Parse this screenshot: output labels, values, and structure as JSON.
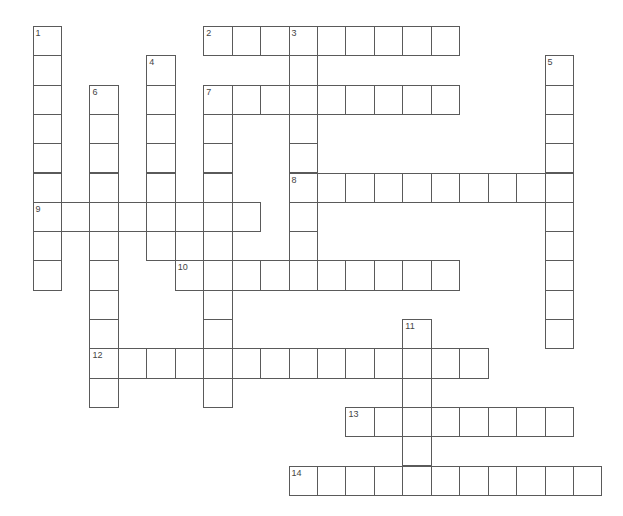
{
  "puzzle": {
    "type": "crossword",
    "grid": {
      "origin_x": 33,
      "origin_y": 26.5,
      "cell_w": 28.45,
      "cell_h": 29.3,
      "line_color": "#5a5a5a",
      "number_color": "#444444"
    },
    "words": [
      {
        "number": "1",
        "direction": "down",
        "row": 0,
        "col": 0,
        "length": 9
      },
      {
        "number": "2",
        "direction": "across",
        "row": 0,
        "col": 6,
        "length": 9
      },
      {
        "number": "3",
        "direction": "down",
        "row": 0,
        "col": 9,
        "length": 9
      },
      {
        "number": "4",
        "direction": "down",
        "row": 1,
        "col": 4,
        "length": 7
      },
      {
        "number": "5",
        "direction": "down",
        "row": 1,
        "col": 18,
        "length": 10
      },
      {
        "number": "6",
        "direction": "down",
        "row": 2,
        "col": 2,
        "length": 11
      },
      {
        "number": "7",
        "direction": "across",
        "row": 2,
        "col": 6,
        "length": 9
      },
      {
        "number": "7",
        "direction": "down",
        "row": 2,
        "col": 6,
        "length": 11
      },
      {
        "number": "8",
        "direction": "across",
        "row": 5,
        "col": 9,
        "length": 10
      },
      {
        "number": "9",
        "direction": "across",
        "row": 6,
        "col": 0,
        "length": 8
      },
      {
        "number": "10",
        "direction": "across",
        "row": 8,
        "col": 5,
        "length": 10
      },
      {
        "number": "11",
        "direction": "down",
        "row": 10,
        "col": 13,
        "length": 6
      },
      {
        "number": "12",
        "direction": "across",
        "row": 11,
        "col": 2,
        "length": 14
      },
      {
        "number": "13",
        "direction": "across",
        "row": 13,
        "col": 11,
        "length": 8
      },
      {
        "number": "14",
        "direction": "across",
        "row": 15,
        "col": 9,
        "length": 11
      }
    ]
  }
}
